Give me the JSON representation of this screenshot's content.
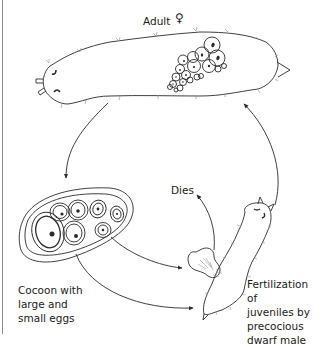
{
  "figure": {
    "type": "life-cycle diagram",
    "clipped_top_caption": "",
    "stages": [
      {
        "id": "adult",
        "label": "Adult",
        "symbol": "♀",
        "symbol_meaning": "female"
      },
      {
        "id": "cocoon",
        "label": "Cocoon with\nlarge and\nsmall eggs"
      },
      {
        "id": "dwarf-male",
        "label": "Dies"
      },
      {
        "id": "fertilization",
        "label": "Fertilization of\njuveniles by\nprecocious\ndwarf male"
      }
    ],
    "arrows": [
      {
        "from": "adult",
        "to": "cocoon"
      },
      {
        "from": "cocoon",
        "to": "dwarf-male"
      },
      {
        "from": "cocoon",
        "to": "fertilization"
      },
      {
        "from": "dwarf-male",
        "to": "dies"
      },
      {
        "from": "fertilization",
        "to": "adult"
      }
    ]
  },
  "labels": {
    "adult": "Adult",
    "female_symbol": "♀",
    "dies": "Dies",
    "cocoon": "Cocoon with\nlarge and\nsmall eggs",
    "fertilization": "Fertilization of\njuveniles by\nprecocious\ndwarf male"
  },
  "colors": {
    "line": "#2b2b2b",
    "text": "#1a1a1a",
    "bristle": "#9a9a9a",
    "background": "#ffffff"
  }
}
